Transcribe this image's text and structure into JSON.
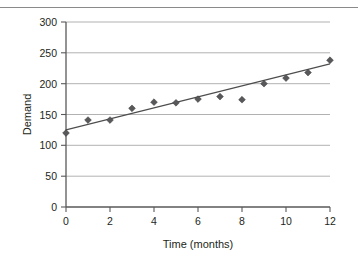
{
  "chart_data": {
    "type": "scatter",
    "title": "",
    "xlabel": "Time (months)",
    "ylabel": "Demand",
    "xlim": [
      0,
      12
    ],
    "ylim": [
      0,
      300
    ],
    "grid": true,
    "legend": "none",
    "x_ticks": [
      "0",
      "2",
      "4",
      "6",
      "8",
      "10",
      "12"
    ],
    "y_ticks": [
      "0",
      "50",
      "100",
      "150",
      "200",
      "250",
      "300"
    ],
    "x": [
      0,
      1,
      2,
      3,
      4,
      5,
      6,
      7,
      8,
      9,
      10,
      11,
      12
    ],
    "series": [
      {
        "name": "Demand",
        "marker": "diamond",
        "color": "#58585a",
        "values": [
          120,
          141,
          141,
          160,
          170,
          169,
          175,
          179,
          174,
          200,
          209,
          218,
          238
        ]
      }
    ],
    "trend_line": {
      "name": "linear trend",
      "color": "#4d4d4d",
      "x_start": 0,
      "y_start": 125,
      "x_end": 12,
      "y_end": 232
    }
  },
  "figure": {
    "background_color": "#ffffff",
    "gridline_color": "#a9a9a9",
    "axis_color": "#595959",
    "text_color": "#231f20"
  }
}
